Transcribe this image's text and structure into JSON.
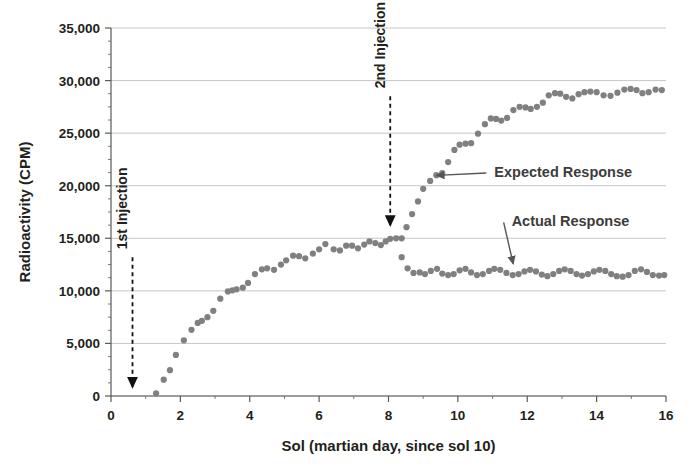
{
  "chart_data": {
    "type": "scatter",
    "title": "",
    "xlabel": "Sol  (martian day, since sol 10)",
    "ylabel": "Radioactivity (CPM)",
    "xlim": [
      0,
      16
    ],
    "ylim": [
      0,
      35000
    ],
    "xticks": [
      0,
      2,
      4,
      6,
      8,
      10,
      12,
      14,
      16
    ],
    "xtick_labels": [
      "0",
      "2",
      "4",
      "6",
      "8",
      "10",
      "12",
      "14",
      "16"
    ],
    "yticks": [
      0,
      5000,
      10000,
      15000,
      20000,
      25000,
      30000,
      35000
    ],
    "ytick_labels": [
      "0",
      "5,000",
      "10,000",
      "15,000",
      "20,000",
      "25,000",
      "30,000",
      "35,000"
    ],
    "minor_ytick_step": 1250,
    "grid": "horizontal",
    "legend": "none",
    "marker_color": "#808080",
    "marker_shape": "circle",
    "marker_size": 5,
    "gridline_color": "#bfbfbf",
    "axis_color": "#595959",
    "series": [
      {
        "name": "Shared / pre-second-injection response",
        "points": [
          [
            1.3,
            250
          ],
          [
            1.52,
            1550
          ],
          [
            1.7,
            2450
          ],
          [
            1.87,
            3900
          ],
          [
            2.1,
            5300
          ],
          [
            2.32,
            6300
          ],
          [
            2.5,
            6950
          ],
          [
            2.62,
            7150
          ],
          [
            2.78,
            7500
          ],
          [
            2.95,
            8100
          ],
          [
            3.15,
            9250
          ],
          [
            3.37,
            9950
          ],
          [
            3.5,
            10050
          ],
          [
            3.62,
            10150
          ],
          [
            3.8,
            10300
          ],
          [
            3.95,
            10750
          ],
          [
            4.15,
            11600
          ],
          [
            4.35,
            12050
          ],
          [
            4.5,
            12150
          ],
          [
            4.7,
            12000
          ],
          [
            4.9,
            12500
          ],
          [
            5.05,
            12900
          ],
          [
            5.25,
            13350
          ],
          [
            5.42,
            13300
          ],
          [
            5.6,
            13100
          ],
          [
            5.82,
            13550
          ],
          [
            6.0,
            13950
          ],
          [
            6.18,
            14450
          ],
          [
            6.42,
            13950
          ],
          [
            6.6,
            13850
          ],
          [
            6.78,
            14300
          ],
          [
            6.95,
            14300
          ],
          [
            7.12,
            14050
          ],
          [
            7.3,
            14400
          ],
          [
            7.45,
            14700
          ],
          [
            7.62,
            14550
          ],
          [
            7.78,
            14350
          ],
          [
            7.92,
            14700
          ],
          [
            8.05,
            14950
          ],
          [
            8.22,
            15000
          ]
        ]
      },
      {
        "name": "Expected Response",
        "points": [
          [
            8.38,
            15000
          ],
          [
            8.52,
            16050
          ],
          [
            8.68,
            17300
          ],
          [
            8.85,
            18500
          ],
          [
            9.0,
            19700
          ],
          [
            9.2,
            20450
          ],
          [
            9.38,
            21000
          ],
          [
            9.55,
            21200
          ],
          [
            9.72,
            22250
          ],
          [
            9.9,
            23400
          ],
          [
            10.05,
            23900
          ],
          [
            10.22,
            24000
          ],
          [
            10.38,
            24050
          ],
          [
            10.58,
            24950
          ],
          [
            10.78,
            25850
          ],
          [
            10.95,
            26400
          ],
          [
            11.1,
            26350
          ],
          [
            11.25,
            26200
          ],
          [
            11.42,
            26450
          ],
          [
            11.6,
            27200
          ],
          [
            11.78,
            27500
          ],
          [
            11.95,
            27450
          ],
          [
            12.1,
            27300
          ],
          [
            12.28,
            27500
          ],
          [
            12.45,
            27900
          ],
          [
            12.62,
            28600
          ],
          [
            12.8,
            28800
          ],
          [
            12.95,
            28750
          ],
          [
            13.12,
            28450
          ],
          [
            13.3,
            28300
          ],
          [
            13.48,
            28700
          ],
          [
            13.65,
            28900
          ],
          [
            13.82,
            28950
          ],
          [
            14.0,
            28900
          ],
          [
            14.2,
            28600
          ],
          [
            14.4,
            28550
          ],
          [
            14.6,
            28850
          ],
          [
            14.8,
            29150
          ],
          [
            14.98,
            29200
          ],
          [
            15.15,
            29100
          ],
          [
            15.32,
            28800
          ],
          [
            15.5,
            28900
          ],
          [
            15.7,
            29150
          ],
          [
            15.88,
            29100
          ]
        ]
      },
      {
        "name": "Actual Response",
        "points": [
          [
            8.38,
            13200
          ],
          [
            8.55,
            12150
          ],
          [
            8.72,
            11700
          ],
          [
            8.9,
            11750
          ],
          [
            9.05,
            11600
          ],
          [
            9.22,
            11900
          ],
          [
            9.4,
            12100
          ],
          [
            9.55,
            11650
          ],
          [
            9.72,
            11500
          ],
          [
            9.88,
            11600
          ],
          [
            10.05,
            11950
          ],
          [
            10.22,
            12100
          ],
          [
            10.38,
            11750
          ],
          [
            10.55,
            11500
          ],
          [
            10.72,
            11600
          ],
          [
            10.9,
            11900
          ],
          [
            11.05,
            12100
          ],
          [
            11.22,
            12000
          ],
          [
            11.4,
            11700
          ],
          [
            11.58,
            11500
          ],
          [
            11.75,
            11600
          ],
          [
            11.92,
            11850
          ],
          [
            12.08,
            12000
          ],
          [
            12.25,
            11850
          ],
          [
            12.42,
            11550
          ],
          [
            12.58,
            11400
          ],
          [
            12.75,
            11600
          ],
          [
            12.92,
            11900
          ],
          [
            13.08,
            12050
          ],
          [
            13.25,
            11900
          ],
          [
            13.42,
            11600
          ],
          [
            13.58,
            11450
          ],
          [
            13.75,
            11600
          ],
          [
            13.92,
            11850
          ],
          [
            14.08,
            12000
          ],
          [
            14.25,
            11900
          ],
          [
            14.42,
            11600
          ],
          [
            14.58,
            11400
          ],
          [
            14.75,
            11350
          ],
          [
            14.92,
            11500
          ],
          [
            15.1,
            11900
          ],
          [
            15.28,
            12050
          ],
          [
            15.45,
            11800
          ],
          [
            15.62,
            11500
          ],
          [
            15.8,
            11450
          ],
          [
            15.95,
            11500
          ]
        ]
      }
    ],
    "annotations": [
      {
        "name": "first-injection",
        "text": "1st Injection",
        "orientation": "vertical",
        "x": 0.62,
        "arrow_from_y": 13200,
        "arrow_to_y": 0,
        "arrow_style": "dashed"
      },
      {
        "name": "second-injection",
        "text": "2nd Injection",
        "orientation": "vertical",
        "x": 8.05,
        "arrow_from_y": 28500,
        "arrow_to_y": 15400,
        "arrow_style": "dashed"
      },
      {
        "name": "expected-response-callout",
        "text": "Expected Response",
        "orientation": "horizontal",
        "label_x": 11.05,
        "label_y": 21400,
        "arrow_tip_x": 9.25,
        "arrow_tip_y": 20700,
        "arrow_style": "solid"
      },
      {
        "name": "actual-response-callout",
        "text": "Actual Response",
        "orientation": "horizontal",
        "label_x": 11.55,
        "label_y": 16700,
        "arrow_tip_x": 11.45,
        "arrow_tip_y": 12300,
        "arrow_style": "solid"
      }
    ]
  }
}
